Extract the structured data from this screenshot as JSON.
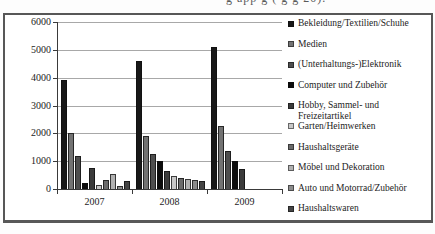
{
  "top_clipped_text": "g  app     g  (  g         g 20).",
  "chart_data": {
    "type": "bar",
    "title": "",
    "xlabel": "",
    "ylabel": "",
    "categories": [
      "2007",
      "2008",
      "2009"
    ],
    "ylim": [
      0,
      6000
    ],
    "ytick_step": 1000,
    "grid": true,
    "legend_position": "right",
    "series": [
      {
        "name": "Bekleidung/Textilien/Schuhe",
        "color": "#181818",
        "values": [
          3900,
          4600,
          5100
        ]
      },
      {
        "name": "Medien",
        "color": "#737373",
        "values": [
          2000,
          1900,
          2250
        ]
      },
      {
        "name": "(Unterhaltungs-)Elektronik",
        "color": "#4e4e4e",
        "values": [
          1200,
          1250,
          1350
        ]
      },
      {
        "name": "Computer und Zubehör",
        "color": "#0c0c0c",
        "values": [
          200,
          1000,
          1000
        ]
      },
      {
        "name": "Hobby, Sammel- und Freizeitartikel",
        "color": "#3b3b3b",
        "values": [
          750,
          650,
          720
        ]
      },
      {
        "name": "Garten/Heimwerken",
        "color": "#c7c7c7",
        "values": [
          150,
          480,
          0
        ]
      },
      {
        "name": "Haushaltsgeräte",
        "color": "#6a6a6a",
        "values": [
          320,
          380,
          0
        ]
      },
      {
        "name": "Möbel und Dekoration",
        "color": "#b1b1b1",
        "values": [
          550,
          350,
          0
        ]
      },
      {
        "name": "Auto und Motorrad/Zubehör",
        "color": "#8c8c8c",
        "values": [
          120,
          330,
          0
        ]
      },
      {
        "name": "Haushaltswaren",
        "color": "#454545",
        "values": [
          290,
          300,
          0
        ]
      }
    ]
  }
}
